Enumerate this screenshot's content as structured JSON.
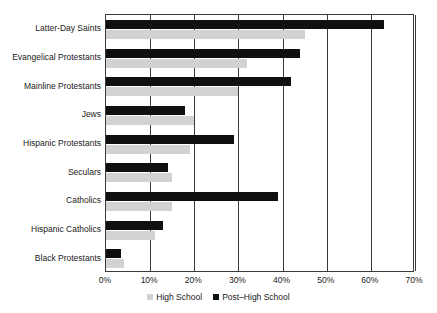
{
  "chart_data": {
    "type": "bar",
    "orientation": "horizontal",
    "title": "",
    "xlabel": "",
    "ylabel": "",
    "xlim": [
      0,
      70
    ],
    "xticks": [
      "0%",
      "10%",
      "20%",
      "30%",
      "40%",
      "50%",
      "60%",
      "70%"
    ],
    "xtick_values": [
      0,
      10,
      20,
      30,
      40,
      50,
      60,
      70
    ],
    "grid": true,
    "legend_position": "bottom",
    "categories": [
      "Latter-Day Saints",
      "Evangelical Protestants",
      "Mainline Protestants",
      "Jews",
      "Hispanic Protestants",
      "Seculars",
      "Catholics",
      "Hispanic Catholics",
      "Black Protestants"
    ],
    "series": [
      {
        "name": "High School",
        "color": "#d2d2d2",
        "values": [
          45,
          32,
          30,
          20,
          19,
          15,
          15,
          11,
          4
        ]
      },
      {
        "name": "Post–High School",
        "color": "#101010",
        "values": [
          63,
          44,
          42,
          18,
          29,
          14,
          39,
          13,
          3.5
        ]
      }
    ]
  },
  "legend": {
    "items": [
      {
        "label": "High School",
        "swatch": "legend-swatch-high-school"
      },
      {
        "label": "Post–High School",
        "swatch": "legend-swatch-post-high-school"
      }
    ]
  }
}
